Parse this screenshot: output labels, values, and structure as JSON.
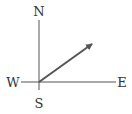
{
  "diagram": {
    "type": "compass-vector",
    "labels": {
      "north": "N",
      "south": "S",
      "east": "E",
      "west": "W"
    },
    "colors": {
      "axis": "#555555",
      "vector": "#555555",
      "text": "#333333"
    },
    "vector": {
      "direction": "north-east",
      "angle_from_east_deg": 33
    }
  }
}
